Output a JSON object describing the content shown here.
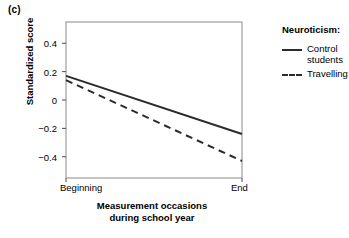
{
  "panel_label": "(c)",
  "legend": {
    "title": "Neurotic​ism:",
    "entries": [
      {
        "label": "Control\nstudents",
        "style": "solid"
      },
      {
        "label": "Travelling",
        "style": "dashed"
      }
    ]
  },
  "chart_data": {
    "type": "line",
    "title": "",
    "xlabel": "Measurement occasions during school year",
    "xlabel_lines": [
      "Measurement occasions",
      "during school year"
    ],
    "ylabel": "Standardized score",
    "x": [
      "Beginning",
      "End"
    ],
    "xtick_labels": [
      "Beginning",
      "End"
    ],
    "ytick_labels": [
      "0.4",
      "0.2",
      "0",
      "−0.2",
      "−0.4"
    ],
    "yticks": [
      0.4,
      0.2,
      0,
      -0.2,
      -0.4
    ],
    "ylim": [
      -0.55,
      0.55
    ],
    "grid": false,
    "legend_position": "right",
    "series": [
      {
        "name": "Control students",
        "style": "solid",
        "color": "#2b2b2b",
        "values": [
          0.17,
          -0.24
        ]
      },
      {
        "name": "Travelling",
        "style": "dashed",
        "color": "#2b2b2b",
        "values": [
          0.14,
          -0.43
        ]
      }
    ]
  }
}
